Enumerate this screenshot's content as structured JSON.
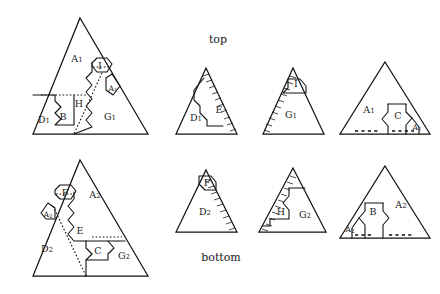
{
  "figure": {
    "background_color": "#ffffff",
    "line_color": "#111111",
    "captions": {
      "top": "top",
      "bottom": "bottom"
    }
  },
  "panels": [
    {
      "id": "main-top",
      "name": "main-top-triangle",
      "row": "top",
      "kind": "large",
      "apex": [
        80,
        18
      ],
      "base_left": [
        33,
        134
      ],
      "base_right": [
        148,
        134
      ],
      "region_labels": [
        {
          "text": "A",
          "sub": "1",
          "x": 77,
          "y": 59
        },
        {
          "text": "I",
          "sub": "",
          "x": 100,
          "y": 68
        },
        {
          "text": "A",
          "sub": "1",
          "x": 113,
          "y": 90
        },
        {
          "text": "H",
          "sub": "",
          "x": 78,
          "y": 103
        },
        {
          "text": "B",
          "sub": "",
          "x": 63,
          "y": 117
        },
        {
          "text": "D",
          "sub": "1",
          "x": 44,
          "y": 119
        },
        {
          "text": "G",
          "sub": "1",
          "x": 110,
          "y": 117
        }
      ]
    },
    {
      "id": "main-bottom",
      "name": "main-bottom-triangle",
      "row": "bottom",
      "kind": "large",
      "apex": [
        80,
        160
      ],
      "base_left": [
        33,
        276
      ],
      "base_right": [
        148,
        276
      ],
      "region_labels": [
        {
          "text": "F",
          "sub": "",
          "x": 65,
          "y": 196
        },
        {
          "text": "A",
          "sub": "2",
          "x": 93,
          "y": 196
        },
        {
          "text": "A",
          "sub": "2",
          "x": 47,
          "y": 215
        },
        {
          "text": "E",
          "sub": "",
          "x": 78,
          "y": 230
        },
        {
          "text": "D",
          "sub": "2",
          "x": 47,
          "y": 248
        },
        {
          "text": "C",
          "sub": "",
          "x": 98,
          "y": 248
        },
        {
          "text": "G",
          "sub": "2",
          "x": 123,
          "y": 254
        }
      ]
    },
    {
      "id": "piece-top-1",
      "name": "piece-triangle-d1-e",
      "row": "top",
      "kind": "piece",
      "apex": [
        206,
        68
      ],
      "base_left": [
        176,
        134
      ],
      "base_right": [
        237,
        134
      ],
      "hatch_edge": "right",
      "region_labels": [
        {
          "text": "D",
          "sub": "1",
          "x": 196,
          "y": 118
        },
        {
          "text": "E",
          "sub": "",
          "x": 219,
          "y": 111
        }
      ]
    },
    {
      "id": "piece-top-2",
      "name": "piece-triangle-i-g1",
      "row": "top",
      "kind": "piece",
      "apex": [
        293,
        68
      ],
      "base_left": [
        263,
        134
      ],
      "base_right": [
        324,
        134
      ],
      "hatch_edge": "left",
      "region_labels": [
        {
          "text": "I",
          "sub": "",
          "x": 295,
          "y": 84
        },
        {
          "text": "G",
          "sub": "1",
          "x": 291,
          "y": 115
        }
      ]
    },
    {
      "id": "piece-top-3",
      "name": "piece-triangle-a1-c-a1",
      "row": "top",
      "kind": "piece",
      "apex": [
        385,
        62
      ],
      "base_left": [
        340,
        134
      ],
      "base_right": [
        430,
        134
      ],
      "hatch_edge": "base-dots",
      "region_labels": [
        {
          "text": "A",
          "sub": "1",
          "x": 370,
          "y": 110
        },
        {
          "text": "C",
          "sub": "",
          "x": 399,
          "y": 116
        },
        {
          "text": "A",
          "sub": "1",
          "x": 418,
          "y": 127
        }
      ]
    },
    {
      "id": "piece-bottom-1",
      "name": "piece-triangle-f-d2",
      "row": "bottom",
      "kind": "piece",
      "apex": [
        206,
        170
      ],
      "base_left": [
        176,
        232
      ],
      "base_right": [
        237,
        232
      ],
      "hatch_edge": "right",
      "region_labels": [
        {
          "text": "F",
          "sub": "",
          "x": 206,
          "y": 183
        },
        {
          "text": "D",
          "sub": "2",
          "x": 205,
          "y": 212
        }
      ]
    },
    {
      "id": "piece-bottom-2",
      "name": "piece-triangle-h-g2",
      "row": "bottom",
      "kind": "piece",
      "apex": [
        293,
        168
      ],
      "base_left": [
        259,
        232
      ],
      "base_right": [
        326,
        232
      ],
      "hatch_edge": "left",
      "region_labels": [
        {
          "text": "H",
          "sub": "",
          "x": 281,
          "y": 211
        },
        {
          "text": "G",
          "sub": "2",
          "x": 305,
          "y": 214
        }
      ]
    },
    {
      "id": "piece-bottom-3",
      "name": "piece-triangle-a2-b-a2",
      "row": "bottom",
      "kind": "piece",
      "apex": [
        385,
        166
      ],
      "base_left": [
        340,
        238
      ],
      "base_right": [
        430,
        238
      ],
      "hatch_edge": "base-dots",
      "region_labels": [
        {
          "text": "A",
          "sub": "2",
          "x": 350,
          "y": 229
        },
        {
          "text": "B",
          "sub": "",
          "x": 372,
          "y": 211
        },
        {
          "text": "A",
          "sub": "2",
          "x": 400,
          "y": 205
        }
      ]
    }
  ]
}
